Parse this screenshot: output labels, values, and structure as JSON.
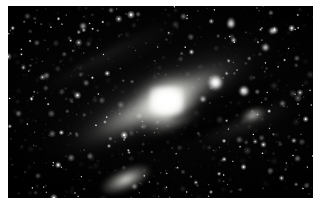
{
  "image": {
    "kind": "astronomical-photograph",
    "subject": "Andromeda Galaxy (M31)",
    "rendering": "grayscale",
    "border": {
      "color": "#ffffff",
      "left_px": 8,
      "top_px": 6,
      "bottom_px": 7,
      "right_px": 0
    },
    "plate": {
      "background_color": "#000000",
      "width_px": 305,
      "height_px": 192
    }
  },
  "scene": {
    "galaxy": {
      "name": "M31",
      "type": "spiral-galaxy",
      "inclination_note": "highly inclined, near edge-on",
      "major_axis_angle_deg": -26,
      "nucleus": {
        "x_pct": 52,
        "y_pct": 49,
        "peak_color": "#ffffff"
      },
      "disk_extent_pct": {
        "width": 96,
        "height": 88
      },
      "dust_lanes": 4,
      "spiral_arms": 2
    },
    "companions": [
      {
        "name": "M110",
        "type": "elliptical-companion-galaxy",
        "x_pct": 38.5,
        "y_pct": 90.5,
        "width_pct": 17,
        "height_pct": 11,
        "angle_deg": -24,
        "core_color": "#e8e8e4"
      },
      {
        "name": "M32",
        "type": "elliptical-companion-galaxy",
        "x_pct": 80.5,
        "y_pct": 56.5,
        "width_pct": 8,
        "height_pct": 6,
        "angle_deg": -20,
        "core_color": "#d8d8d4"
      }
    ],
    "bright_stars": [
      {
        "id": "star-a",
        "x_pct": 68.0,
        "y_pct": 40.0,
        "size_px": 15,
        "brightness": 1.0
      },
      {
        "id": "star-b",
        "x_pct": 77.5,
        "y_pct": 44.5,
        "size_px": 10,
        "brightness": 0.9
      },
      {
        "id": "star-c",
        "x_pct": 64.0,
        "y_pct": 48.5,
        "size_px": 6,
        "brightness": 0.7
      },
      {
        "id": "star-d",
        "x_pct": 73.0,
        "y_pct": 9.5,
        "size_px": 8,
        "brightness": 0.85
      },
      {
        "id": "star-e",
        "x_pct": 84.5,
        "y_pct": 21.5,
        "size_px": 7,
        "brightness": 0.8
      },
      {
        "id": "star-f",
        "x_pct": 86.5,
        "y_pct": 13.0,
        "size_px": 6,
        "brightness": 0.75
      },
      {
        "id": "star-g",
        "x_pct": 24.5,
        "y_pct": 10.5,
        "size_px": 6,
        "brightness": 0.7
      },
      {
        "id": "star-h",
        "x_pct": 12.5,
        "y_pct": 36.0,
        "size_px": 5,
        "brightness": 0.65
      },
      {
        "id": "star-i",
        "x_pct": 41.5,
        "y_pct": 94.0,
        "size_px": 5,
        "brightness": 0.65
      },
      {
        "id": "star-j",
        "x_pct": 95.0,
        "y_pct": 79.5,
        "size_px": 5,
        "brightness": 0.6
      },
      {
        "id": "star-k",
        "x_pct": 57.5,
        "y_pct": 5.5,
        "size_px": 5,
        "brightness": 0.6
      },
      {
        "id": "star-l",
        "x_pct": 3.5,
        "y_pct": 56.0,
        "size_px": 5,
        "brightness": 0.6
      },
      {
        "id": "star-m",
        "x_pct": 90.0,
        "y_pct": 51.0,
        "size_px": 5,
        "brightness": 0.6
      },
      {
        "id": "star-n",
        "x_pct": 33.0,
        "y_pct": 73.0,
        "size_px": 4,
        "brightness": 0.55
      },
      {
        "id": "star-o",
        "x_pct": 66.5,
        "y_pct": 97.0,
        "size_px": 4,
        "brightness": 0.55
      }
    ],
    "starfield": {
      "faint_star_count": 760,
      "seed": 20240931,
      "color": "#ffffff",
      "max_radius_px": 1.8
    }
  }
}
